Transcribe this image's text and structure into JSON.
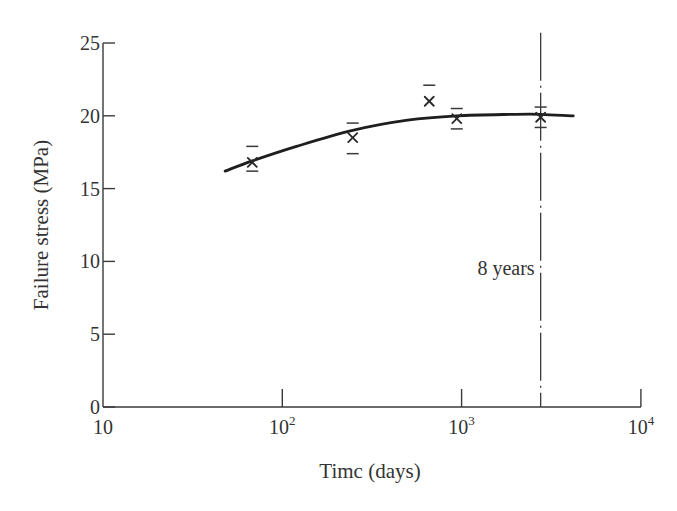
{
  "chart_data": {
    "type": "scatter",
    "title": "",
    "xlabel": "Timc (days)",
    "ylabel": "Failure stress (MPa)",
    "xscale": "log",
    "xlim": [
      10,
      10000
    ],
    "ylim": [
      0,
      25
    ],
    "grid": false,
    "legend": null,
    "x_ticks": [
      {
        "value": 10,
        "base": "10",
        "exp": ""
      },
      {
        "value": 100,
        "base": "10",
        "exp": "2"
      },
      {
        "value": 1000,
        "base": "10",
        "exp": "3"
      },
      {
        "value": 10000,
        "base": "10",
        "exp": "4"
      }
    ],
    "y_ticks": [
      0,
      5,
      10,
      15,
      20,
      25
    ],
    "series": [
      {
        "name": "Measured failure stress",
        "marker": "x",
        "points": [
          {
            "x": 68,
            "y": 16.8,
            "err_high": 17.9,
            "err_low": 16.2
          },
          {
            "x": 247,
            "y": 18.5,
            "err_high": 19.5,
            "err_low": 17.4
          },
          {
            "x": 660,
            "y": 21.0,
            "err_high": 22.1,
            "err_low": null
          },
          {
            "x": 940,
            "y": 19.8,
            "err_high": 20.5,
            "err_low": 19.1
          },
          {
            "x": 2760,
            "y": 19.9,
            "err_high": 20.6,
            "err_low": 19.2
          }
        ]
      },
      {
        "name": "Fitted trend",
        "style": "solid-curve",
        "points": [
          {
            "x": 48,
            "y": 16.2
          },
          {
            "x": 68,
            "y": 16.9
          },
          {
            "x": 120,
            "y": 17.9
          },
          {
            "x": 247,
            "y": 19.0
          },
          {
            "x": 500,
            "y": 19.7
          },
          {
            "x": 940,
            "y": 20.0
          },
          {
            "x": 2000,
            "y": 20.1
          },
          {
            "x": 2760,
            "y": 20.1
          },
          {
            "x": 4200,
            "y": 20.0
          }
        ]
      }
    ],
    "annotations": [
      {
        "type": "vertical-line",
        "style": "dash-dot",
        "x": 2760,
        "y_top": 25.7,
        "label": "8 years"
      }
    ]
  },
  "layout": {
    "plot_left": 103,
    "plot_bottom": 407,
    "px_per_decade": 179.3,
    "px_per_mpa": 14.56
  }
}
